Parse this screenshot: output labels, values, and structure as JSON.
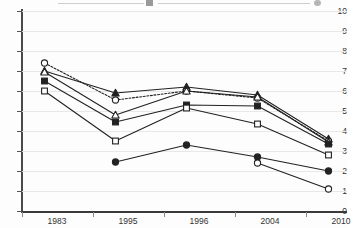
{
  "chart_data": {
    "type": "line",
    "title": "",
    "subtitle": "",
    "xlabel": "",
    "ylabel": "",
    "categories": [
      "1983",
      "1995",
      "1996",
      "2004",
      "2010"
    ],
    "ylim": [
      0,
      10
    ],
    "xlim_categories": 5,
    "yticks": [
      "0",
      "1",
      "2",
      "3",
      "4",
      "5",
      "6",
      "7",
      "8",
      "9",
      "10"
    ],
    "grid": true,
    "grid_axis": "y",
    "legend": "none-visible-cropped-at-top",
    "series": [
      {
        "name": "Series A",
        "marker": "triangle-filled",
        "linestyle": "solid",
        "color": "#222222",
        "x": [
          "1983",
          "1995",
          "1996",
          "2004",
          "2010"
        ],
        "values": [
          7.0,
          5.9,
          6.2,
          5.8,
          3.6
        ]
      },
      {
        "name": "Series B",
        "marker": "circle-open",
        "linestyle": "dotted",
        "color": "#222222",
        "x": [
          "1983",
          "1995",
          "1996",
          "2004",
          "2010"
        ],
        "values": [
          7.4,
          5.55,
          6.0,
          5.65,
          3.5
        ]
      },
      {
        "name": "Series C",
        "marker": "triangle-open",
        "linestyle": "solid",
        "color": "#222222",
        "x": [
          "1983",
          "1995",
          "1996",
          "2004",
          "2010"
        ],
        "values": [
          6.95,
          4.8,
          6.0,
          5.7,
          3.45
        ]
      },
      {
        "name": "Series D",
        "marker": "square-filled",
        "linestyle": "solid",
        "color": "#222222",
        "x": [
          "1983",
          "1995",
          "1996",
          "2004",
          "2010"
        ],
        "values": [
          6.5,
          4.45,
          5.3,
          5.25,
          3.35
        ]
      },
      {
        "name": "Series E",
        "marker": "square-open",
        "linestyle": "solid",
        "color": "#222222",
        "x": [
          "1983",
          "1995",
          "1996",
          "2004",
          "2010"
        ],
        "values": [
          6.0,
          3.5,
          5.15,
          4.35,
          2.8
        ]
      },
      {
        "name": "Series F",
        "marker": "circle-filled",
        "linestyle": "solid",
        "color": "#222222",
        "x": [
          "1995",
          "1996",
          "2004",
          "2010"
        ],
        "values": [
          2.45,
          3.3,
          2.7,
          2.0
        ]
      },
      {
        "name": "Series G",
        "marker": "circle-open",
        "linestyle": "solid",
        "color": "#222222",
        "x": [
          "2004",
          "2010"
        ],
        "values": [
          2.4,
          1.1
        ]
      }
    ]
  },
  "axes": {
    "y_label_0": "0",
    "y_label_1": "1",
    "y_label_2": "2",
    "y_label_3": "3",
    "y_label_4": "4",
    "y_label_5": "5",
    "y_label_6": "6",
    "y_label_7": "7",
    "y_label_8": "8",
    "y_label_9": "9",
    "y_label_10": "10",
    "x_label_0": "1983",
    "x_label_1": "1995",
    "x_label_2": "1996",
    "x_label_3": "2004",
    "x_label_4": "2010"
  },
  "colors": {
    "ink": "#222222",
    "axis": "#4a4a4a",
    "grid": "#e8e8e8",
    "background": "#fdfdfd",
    "marker_fill_open": "#ffffff"
  }
}
